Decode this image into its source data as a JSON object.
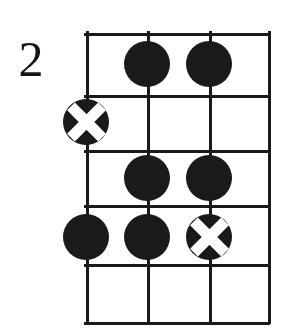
{
  "diagram": {
    "type": "guitar-chord-diagram",
    "starting_fret_label": "2",
    "strings_shown": 4,
    "frets_shown": 5,
    "string_x": [
      0,
      61,
      123,
      182
    ],
    "fret_y": [
      0,
      62,
      117,
      172,
      231,
      289
    ],
    "colors": {
      "ink": "#1a1a1a",
      "paper": "#ffffff",
      "label": "#151515"
    },
    "markers": [
      {
        "id": "m1",
        "kind": "dot",
        "string": 2,
        "fret": 1,
        "x": 61,
        "y": 31,
        "label": "filled-dot-string2-fret1"
      },
      {
        "id": "m2",
        "kind": "dot",
        "string": 3,
        "fret": 1,
        "x": 123,
        "y": 31,
        "label": "filled-dot-string3-fret1"
      },
      {
        "id": "m3",
        "kind": "xmark",
        "string": 1,
        "fret": 2,
        "x": 0,
        "y": 89,
        "label": "x-marker-string1-fret2"
      },
      {
        "id": "m4",
        "kind": "dot",
        "string": 2,
        "fret": 3,
        "x": 61,
        "y": 145,
        "label": "filled-dot-string2-fret3"
      },
      {
        "id": "m5",
        "kind": "dot",
        "string": 3,
        "fret": 3,
        "x": 123,
        "y": 145,
        "label": "filled-dot-string3-fret3"
      },
      {
        "id": "m6",
        "kind": "dot",
        "string": 1,
        "fret": 4,
        "x": 0,
        "y": 204,
        "label": "filled-dot-string1-fret4"
      },
      {
        "id": "m7",
        "kind": "dot",
        "string": 2,
        "fret": 4,
        "x": 61,
        "y": 204,
        "label": "filled-dot-string2-fret4"
      },
      {
        "id": "m8",
        "kind": "xmark",
        "string": 3,
        "fret": 4,
        "x": 123,
        "y": 204,
        "label": "x-marker-string3-fret4"
      }
    ]
  }
}
